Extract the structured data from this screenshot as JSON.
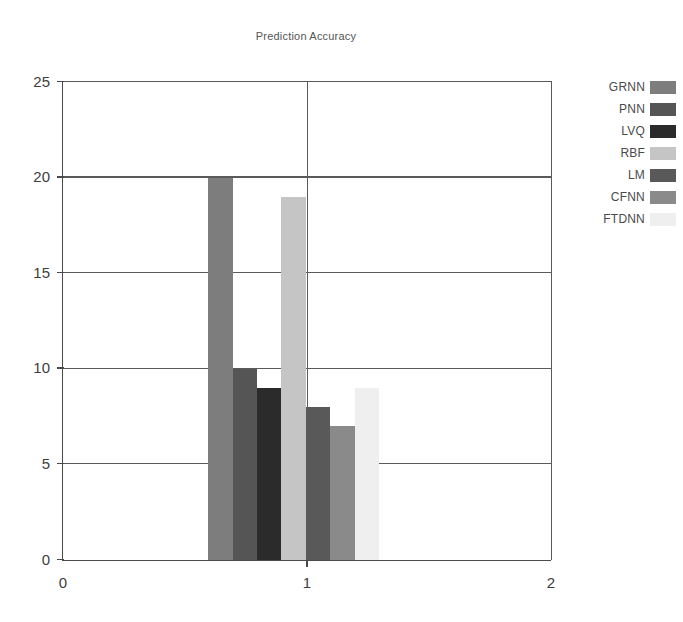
{
  "chart_data": {
    "type": "bar",
    "title": "Prediction Accuracy",
    "xlabel": "",
    "ylabel": "",
    "categories": [
      "GRNN",
      "PNN",
      "LVQ",
      "RBF",
      "LM",
      "CFNN",
      "FTDNN"
    ],
    "values": [
      20,
      10,
      9,
      19,
      8,
      7,
      9
    ],
    "colors": [
      "#7d7d7d",
      "#555555",
      "#2b2b2b",
      "#c5c5c5",
      "#595959",
      "#8a8a8a",
      "#efefef"
    ],
    "bar_x_centers": [
      0.645,
      0.745,
      0.845,
      0.945,
      1.045,
      1.145,
      1.245
    ],
    "bar_width": 0.1,
    "xlim": [
      0,
      2
    ],
    "ylim": [
      0,
      25
    ],
    "xticks": [
      0,
      1,
      2
    ],
    "xtick_labels": [
      "0",
      "1",
      "2"
    ],
    "yticks": [
      0,
      5,
      10,
      15,
      20,
      25
    ],
    "ytick_labels": [
      "0",
      "5",
      "10",
      "15",
      "20",
      "25"
    ],
    "grid": true,
    "gridlines_horizontal": [
      5,
      10,
      15,
      20,
      25
    ],
    "gridlines_vertical": [
      1
    ],
    "legend_position": "right",
    "legend": [
      {
        "label": "GRNN",
        "color": "#7d7d7d"
      },
      {
        "label": "PNN",
        "color": "#555555"
      },
      {
        "label": "LVQ",
        "color": "#2b2b2b"
      },
      {
        "label": "RBF",
        "color": "#c5c5c5"
      },
      {
        "label": "LM",
        "color": "#595959"
      },
      {
        "label": "CFNN",
        "color": "#8a8a8a"
      },
      {
        "label": "FTDNN",
        "color": "#efefef"
      }
    ]
  }
}
